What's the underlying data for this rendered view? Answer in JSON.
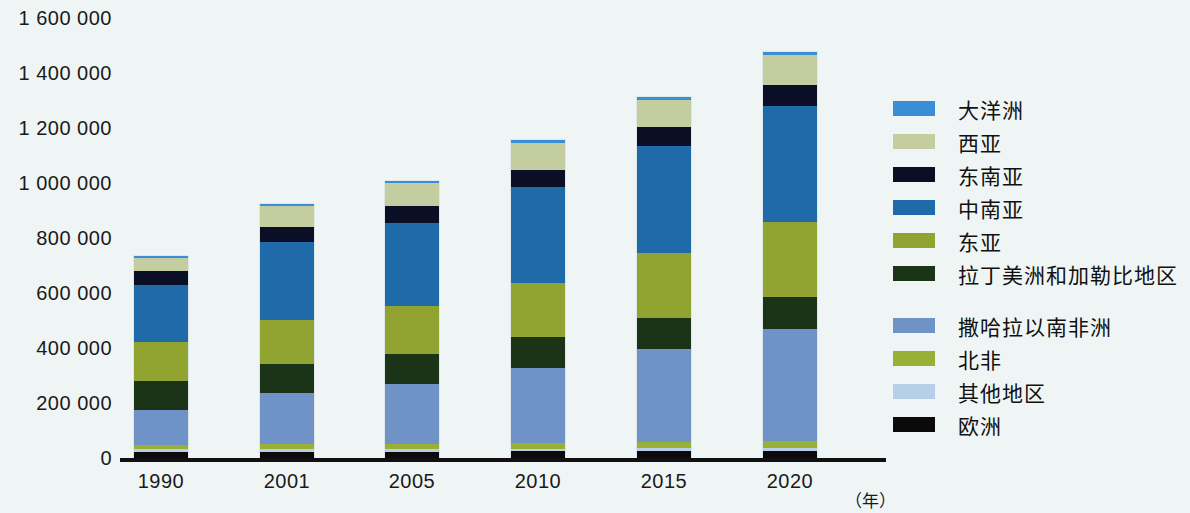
{
  "axis": {
    "y_ticks": [
      "1 600 000",
      "1 400 000",
      "1 200 000",
      "1 000 000",
      "800 000",
      "600 000",
      "400 000",
      "200 000",
      "0"
    ],
    "x_labels": [
      "1990",
      "2001",
      "2005",
      "2010",
      "2015",
      "2020"
    ],
    "x_unit": "（年）"
  },
  "legend": {
    "items": [
      {
        "label": "大洋洲",
        "color": "#3a8ed6"
      },
      {
        "label": "西亚",
        "color": "#c4cda0"
      },
      {
        "label": "东南亚",
        "color": "#0a0f26"
      },
      {
        "label": "中南亚",
        "color": "#1f6aa8"
      },
      {
        "label": "东亚",
        "color": "#91a330"
      },
      {
        "label": "拉丁美洲和加勒比地区",
        "color": "#1b3317"
      },
      {
        "label": "撒哈拉以南非洲",
        "color": "#6f93c6"
      },
      {
        "label": "北非",
        "color": "#9aaf35"
      },
      {
        "label": "其他地区",
        "color": "#b7cfe8"
      },
      {
        "label": "欧洲",
        "color": "#0a0a0a"
      }
    ],
    "gap_after_index": 5
  },
  "chart_data": {
    "type": "bar",
    "stacked": true,
    "title": "",
    "xlabel": "（年）",
    "ylabel": "",
    "ylim": [
      0,
      1600000
    ],
    "ytick_step": 200000,
    "grid": false,
    "legend_position": "right",
    "categories": [
      "1990",
      "2001",
      "2005",
      "2010",
      "2015",
      "2020"
    ],
    "series": [
      {
        "name": "欧洲",
        "color": "#0a0a0a",
        "values": [
          22000,
          23000,
          23000,
          24000,
          25000,
          26000
        ]
      },
      {
        "name": "其他地区",
        "color": "#b7cfe8",
        "values": [
          9000,
          9000,
          9000,
          10000,
          11000,
          11000
        ]
      },
      {
        "name": "北非",
        "color": "#9aaf35",
        "values": [
          16000,
          18000,
          19000,
          21000,
          22000,
          24000
        ]
      },
      {
        "name": "撒哈拉以南非洲",
        "color": "#6f93c6",
        "values": [
          126000,
          185000,
          219000,
          272000,
          338000,
          407000
        ]
      },
      {
        "name": "拉丁美洲和加勒比地区",
        "color": "#1b3317",
        "values": [
          107000,
          108000,
          110000,
          112000,
          114000,
          116000
        ]
      },
      {
        "name": "东亚",
        "color": "#91a330",
        "values": [
          142000,
          158000,
          173000,
          196000,
          234000,
          275000
        ]
      },
      {
        "name": "中南亚",
        "color": "#1f6aa8",
        "values": [
          206000,
          286000,
          303000,
          349000,
          391000,
          422000
        ]
      },
      {
        "name": "东南亚",
        "color": "#0a0f26",
        "values": [
          52000,
          55000,
          60000,
          65000,
          70000,
          76000
        ]
      },
      {
        "name": "西亚",
        "color": "#c4cda0",
        "values": [
          48000,
          73000,
          85000,
          97000,
          98000,
          109000
        ]
      },
      {
        "name": "大洋洲",
        "color": "#3a8ed6",
        "values": [
          7000,
          7000,
          8000,
          9000,
          10000,
          11000
        ]
      }
    ],
    "totals": [
      735000,
      922000,
      1009000,
      1155000,
      1313000,
      1477000
    ]
  }
}
